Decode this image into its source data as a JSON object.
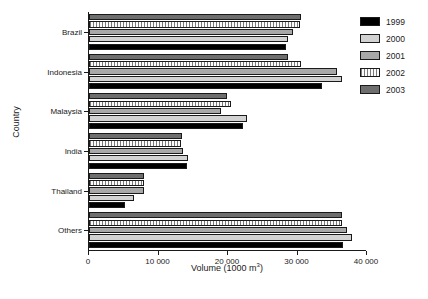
{
  "chart_data": {
    "type": "bar",
    "orientation": "horizontal",
    "title": "",
    "xlabel": "Volume (1000 m3)",
    "xlabel_html": "Volume (1000 m<sup>3</sup>)",
    "ylabel": "Country",
    "categories": [
      "Brazil",
      "Indonesia",
      "Malaysia",
      "India",
      "Thailand",
      "Others"
    ],
    "series": [
      {
        "name": "1999",
        "color": "#000000",
        "values": [
          28300,
          33500,
          22200,
          14100,
          5200,
          36500
        ]
      },
      {
        "name": "2000",
        "color": "#d2d2d2",
        "values": [
          28700,
          36400,
          22700,
          14200,
          6500,
          37800
        ]
      },
      {
        "name": "2001",
        "color": "#a8a8a8",
        "values": [
          29300,
          35700,
          19000,
          13500,
          7900,
          37100
        ]
      },
      {
        "name": "2002",
        "color": "#fbfbfb",
        "values": [
          30300,
          30500,
          20500,
          13200,
          7900,
          36400
        ]
      },
      {
        "name": "2003",
        "color": "#6e6e6e",
        "values": [
          30500,
          28700,
          19800,
          13400,
          7900,
          36400
        ]
      }
    ],
    "xlim": [
      0,
      40000
    ],
    "xticks": [
      0,
      10000,
      20000,
      30000,
      40000
    ],
    "xtick_labels": [
      "0",
      "10 000",
      "20 000",
      "30 000",
      "40 000"
    ],
    "grid": false,
    "legend_position": "right",
    "legend_entries": [
      "1999",
      "2000",
      "2001",
      "2002",
      "2003"
    ]
  }
}
